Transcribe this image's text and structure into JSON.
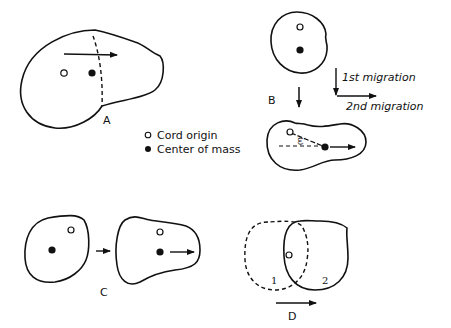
{
  "colors": {
    "ink": "#111111",
    "background": "#ffffff"
  },
  "panels": {
    "a": {
      "label": "A"
    },
    "b": {
      "label": "B",
      "angle_symbol": "ω",
      "first_migration": "1st migration",
      "second_migration": "2nd migration"
    },
    "c": {
      "label": "C"
    },
    "d": {
      "label": "D",
      "outline_1": "1",
      "outline_2": "2"
    }
  },
  "legend": {
    "items": [
      {
        "symbol": "open-circle",
        "label": "Cord origin"
      },
      {
        "symbol": "filled-circle",
        "label": "Center of mass"
      }
    ]
  }
}
